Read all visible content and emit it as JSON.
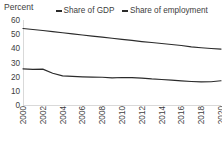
{
  "chart_data": {
    "type": "line",
    "title": "",
    "subtitle": "",
    "xlabel": "",
    "ylabel": "Percent",
    "ylim": [
      0,
      60
    ],
    "xlim": [
      2000,
      2020
    ],
    "grid": false,
    "legend_position": "top",
    "y_ticks": [
      60,
      50,
      40,
      30,
      20,
      10,
      0
    ],
    "x_ticks": [
      2000,
      2002,
      2004,
      2006,
      2008,
      2010,
      2012,
      2014,
      2016,
      2018,
      2020
    ],
    "x": [
      2000,
      2001,
      2002,
      2003,
      2004,
      2005,
      2006,
      2007,
      2008,
      2009,
      2010,
      2011,
      2012,
      2013,
      2014,
      2015,
      2016,
      2017,
      2018,
      2019,
      2020
    ],
    "series": [
      {
        "name": "Share of GDP",
        "color": "#2b2b2b",
        "values": [
          54.0,
          53.3,
          52.6,
          51.8,
          51.0,
          50.2,
          49.4,
          48.6,
          47.9,
          47.1,
          46.3,
          45.6,
          44.8,
          44.1,
          43.4,
          42.7,
          42.0,
          41.0,
          40.4,
          39.9,
          39.5
        ]
      },
      {
        "name": "Share of employment",
        "color": "#2b2b2b",
        "values": [
          25.5,
          25.2,
          25.3,
          22.4,
          20.6,
          20.2,
          19.9,
          19.7,
          19.6,
          19.2,
          19.4,
          19.3,
          19.0,
          18.4,
          18.0,
          17.5,
          17.0,
          16.6,
          16.3,
          16.4,
          17.1
        ]
      }
    ],
    "legend": [
      "Share of GDP",
      "Share of employment"
    ]
  },
  "axis_title": "Percent",
  "legend": {
    "items": [
      {
        "label": "Share of GDP",
        "swatch_icon": "line-swatch-icon"
      },
      {
        "label": "Share of employment",
        "swatch_icon": "line-swatch-icon"
      }
    ]
  }
}
